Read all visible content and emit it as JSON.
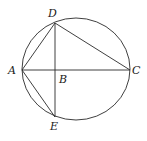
{
  "figure": {
    "type": "geometry",
    "circle": {
      "cx": 76,
      "cy": 69,
      "rx": 54,
      "ry": 51
    },
    "points": {
      "A": {
        "label": "A",
        "x": 22,
        "y": 70
      },
      "B": {
        "label": "B",
        "x": 55,
        "y": 70
      },
      "C": {
        "label": "C",
        "x": 130,
        "y": 70
      },
      "D": {
        "label": "D",
        "x": 55,
        "y": 23
      },
      "E": {
        "label": "E",
        "x": 55,
        "y": 117
      }
    },
    "segments": [
      [
        "A",
        "C"
      ],
      [
        "D",
        "E"
      ],
      [
        "A",
        "D"
      ],
      [
        "D",
        "C"
      ],
      [
        "A",
        "E"
      ]
    ],
    "label_positions": {
      "A": {
        "x": 8,
        "y": 74
      },
      "B": {
        "x": 59,
        "y": 83
      },
      "C": {
        "x": 132,
        "y": 74
      },
      "D": {
        "x": 48,
        "y": 17
      },
      "E": {
        "x": 50,
        "y": 130
      }
    },
    "stroke_color": "#2a2a2a",
    "background": "#ffffff"
  }
}
